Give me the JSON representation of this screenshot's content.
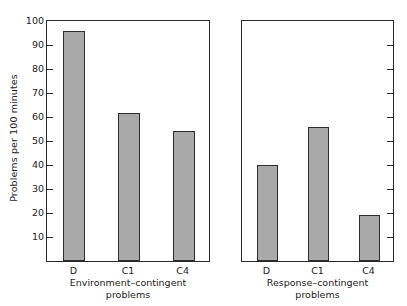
{
  "chart_data": {
    "type": "bar",
    "title": "",
    "subtitle": "",
    "xlabel": "",
    "ylabel": "Problems per 100 minutes",
    "ylim": [
      0,
      100
    ],
    "ytick_labels": [
      "100",
      "90",
      "80",
      "70",
      "60",
      "50",
      "40",
      "30",
      "20",
      "10"
    ],
    "ytick_values": [
      100,
      90,
      80,
      70,
      60,
      50,
      40,
      30,
      20,
      10
    ],
    "grid": false,
    "legend": null,
    "categories": [
      "D",
      "C1",
      "C4"
    ],
    "panels": [
      {
        "name": "environment-contingent",
        "caption_lines": [
          "Environment–contingent",
          "problems"
        ],
        "categories": [
          "D",
          "C1",
          "C4"
        ],
        "values": [
          95,
          61,
          53.5
        ]
      },
      {
        "name": "response-contingent",
        "caption_lines": [
          "Response–contingent",
          "problems"
        ],
        "categories": [
          "D",
          "C1",
          "C4"
        ],
        "values": [
          39.5,
          55,
          18.5
        ]
      }
    ],
    "series": [
      {
        "name": "Environment-contingent problems",
        "values": [
          95,
          61,
          53.5
        ]
      },
      {
        "name": "Response-contingent problems",
        "values": [
          39.5,
          55,
          18.5
        ]
      }
    ],
    "colors": {
      "bar_fill": "#a9a9a9",
      "bar_edge": "#2d2d2d",
      "axis": "#2a2a2a",
      "text": "#1a1a1a",
      "background": "#ffffff"
    }
  }
}
